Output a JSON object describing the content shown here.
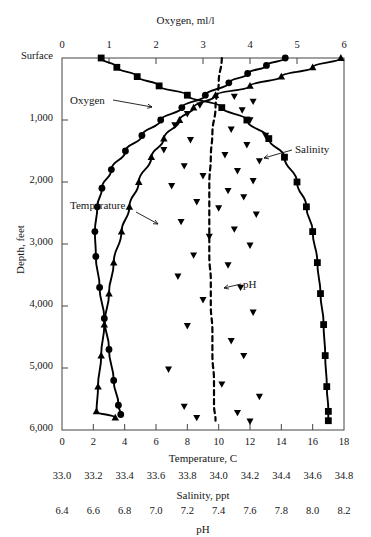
{
  "figure": {
    "type": "depth-profile",
    "top_axis_title": "Oxygen,  ml/l",
    "y_axis_title": "Depth,  feet",
    "bottom_axis_titles": [
      "Temperature,  C",
      "Salinity,  ppt",
      "pH"
    ],
    "surface_label": "Surface"
  },
  "curve_labels": {
    "oxygen": "Oxygen",
    "temperature": "Temperature",
    "salinity": "Salinity",
    "ph": "pH"
  },
  "chart_data": {
    "type": "line",
    "title": "Oxygen,  ml/l",
    "xlabel": "Temperature,  C",
    "ylabel": "Depth,  feet",
    "grid": false,
    "legend": "inline-annotations",
    "y_axis": {
      "label": "Depth,  feet",
      "ticks": [
        "Surface",
        "1,000",
        "2,000",
        "3,000",
        "4,000",
        "5,000",
        "6,000"
      ],
      "values": [
        0,
        1000,
        2000,
        3000,
        4000,
        5000,
        6000
      ],
      "ylim": [
        0,
        6000
      ],
      "inverted": true
    },
    "x_axes": [
      {
        "name": "oxygen",
        "position": "top",
        "label": "Oxygen,  ml/l",
        "ticks": [
          "0",
          "1",
          "2",
          "3",
          "4",
          "5",
          "6"
        ],
        "values": [
          0,
          1,
          2,
          3,
          4,
          5,
          6
        ],
        "xlim": [
          0,
          6
        ]
      },
      {
        "name": "temperature",
        "position": "bottom",
        "label": "Temperature,  C",
        "ticks": [
          "0",
          "2",
          "4",
          "6",
          "8",
          "10",
          "12",
          "14",
          "16",
          "18"
        ],
        "values": [
          0,
          2,
          4,
          6,
          8,
          10,
          12,
          14,
          16,
          18
        ],
        "xlim": [
          0,
          18
        ]
      },
      {
        "name": "salinity",
        "position": "bottom",
        "label": "Salinity,  ppt",
        "ticks": [
          "33.0",
          "33.2",
          "33.4",
          "33.6",
          "33.8",
          "34.0",
          "34.2",
          "34.4",
          "34.6",
          "34.8"
        ],
        "values": [
          33.0,
          33.2,
          33.4,
          33.6,
          33.8,
          34.0,
          34.2,
          34.4,
          34.6,
          34.8
        ],
        "xlim": [
          33.0,
          34.8
        ]
      },
      {
        "name": "ph",
        "position": "bottom",
        "label": "pH",
        "ticks": [
          "6.4",
          "6.6",
          "6.8",
          "7.0",
          "7.2",
          "7.4",
          "7.6",
          "7.8",
          "8.0",
          "8.2"
        ],
        "values": [
          6.4,
          6.6,
          6.8,
          7.0,
          7.2,
          7.4,
          7.6,
          7.8,
          8.0,
          8.2
        ],
        "xlim": [
          6.4,
          8.2
        ]
      }
    ],
    "series": [
      {
        "name": "Oxygen",
        "marker": "circle",
        "axis": "oxygen",
        "unit": "ml/l",
        "points": [
          {
            "depth": 0,
            "value": 4.75
          },
          {
            "depth": 120,
            "value": 4.35
          },
          {
            "depth": 250,
            "value": 3.95
          },
          {
            "depth": 400,
            "value": 3.55
          },
          {
            "depth": 600,
            "value": 3.05
          },
          {
            "depth": 800,
            "value": 2.55
          },
          {
            "depth": 1000,
            "value": 2.1
          },
          {
            "depth": 1250,
            "value": 1.7
          },
          {
            "depth": 1500,
            "value": 1.35
          },
          {
            "depth": 1800,
            "value": 1.05
          },
          {
            "depth": 2100,
            "value": 0.85
          },
          {
            "depth": 2400,
            "value": 0.75
          },
          {
            "depth": 2800,
            "value": 0.7
          },
          {
            "depth": 3200,
            "value": 0.72
          },
          {
            "depth": 3700,
            "value": 0.8
          },
          {
            "depth": 4200,
            "value": 0.9
          },
          {
            "depth": 4700,
            "value": 1.0
          },
          {
            "depth": 5200,
            "value": 1.1
          },
          {
            "depth": 5600,
            "value": 1.2
          },
          {
            "depth": 5750,
            "value": 1.25
          }
        ]
      },
      {
        "name": "Temperature",
        "marker": "triangle-up",
        "axis": "temperature",
        "unit": "C",
        "points": [
          {
            "depth": 0,
            "value": 17.8
          },
          {
            "depth": 150,
            "value": 16.0
          },
          {
            "depth": 300,
            "value": 14.0
          },
          {
            "depth": 450,
            "value": 12.0
          },
          {
            "depth": 600,
            "value": 9.8
          },
          {
            "depth": 800,
            "value": 8.4
          },
          {
            "depth": 1000,
            "value": 7.5
          },
          {
            "depth": 1300,
            "value": 6.5
          },
          {
            "depth": 1600,
            "value": 5.7
          },
          {
            "depth": 2000,
            "value": 4.9
          },
          {
            "depth": 2400,
            "value": 4.3
          },
          {
            "depth": 2800,
            "value": 3.8
          },
          {
            "depth": 3300,
            "value": 3.3
          },
          {
            "depth": 3800,
            "value": 3.0
          },
          {
            "depth": 4300,
            "value": 2.7
          },
          {
            "depth": 4800,
            "value": 2.5
          },
          {
            "depth": 5300,
            "value": 2.3
          },
          {
            "depth": 5700,
            "value": 2.2
          },
          {
            "depth": 5800,
            "value": 3.4
          }
        ]
      },
      {
        "name": "Salinity",
        "marker": "square",
        "axis": "salinity",
        "unit": "ppt",
        "points": [
          {
            "depth": 0,
            "value": 33.25
          },
          {
            "depth": 150,
            "value": 33.35
          },
          {
            "depth": 300,
            "value": 33.48
          },
          {
            "depth": 450,
            "value": 33.62
          },
          {
            "depth": 600,
            "value": 33.8
          },
          {
            "depth": 800,
            "value": 34.02
          },
          {
            "depth": 1000,
            "value": 34.18
          },
          {
            "depth": 1300,
            "value": 34.32
          },
          {
            "depth": 1600,
            "value": 34.42
          },
          {
            "depth": 2000,
            "value": 34.5
          },
          {
            "depth": 2400,
            "value": 34.56
          },
          {
            "depth": 2800,
            "value": 34.6
          },
          {
            "depth": 3300,
            "value": 34.63
          },
          {
            "depth": 3800,
            "value": 34.65
          },
          {
            "depth": 4300,
            "value": 34.67
          },
          {
            "depth": 4800,
            "value": 34.68
          },
          {
            "depth": 5300,
            "value": 34.69
          },
          {
            "depth": 5700,
            "value": 34.7
          },
          {
            "depth": 5850,
            "value": 34.7
          }
        ]
      },
      {
        "name": "pH",
        "marker": "triangle-down",
        "axis": "ph",
        "unit": "",
        "line_style": "dashed",
        "points": [
          {
            "depth": 0,
            "value": 7.42
          },
          {
            "depth": 400,
            "value": 7.4
          },
          {
            "depth": 800,
            "value": 7.38
          },
          {
            "depth": 1200,
            "value": 7.36
          },
          {
            "depth": 1600,
            "value": 7.35
          },
          {
            "depth": 2000,
            "value": 7.34
          },
          {
            "depth": 2400,
            "value": 7.34
          },
          {
            "depth": 2800,
            "value": 7.34
          },
          {
            "depth": 3200,
            "value": 7.34
          },
          {
            "depth": 3600,
            "value": 7.35
          },
          {
            "depth": 4000,
            "value": 7.35
          },
          {
            "depth": 4400,
            "value": 7.36
          },
          {
            "depth": 4800,
            "value": 7.36
          },
          {
            "depth": 5200,
            "value": 7.37
          },
          {
            "depth": 5600,
            "value": 7.37
          },
          {
            "depth": 5850,
            "value": 7.38
          }
        ],
        "scatter": [
          {
            "depth": 620,
            "value": 7.5
          },
          {
            "depth": 700,
            "value": 7.62
          },
          {
            "depth": 760,
            "value": 7.28
          },
          {
            "depth": 840,
            "value": 7.55
          },
          {
            "depth": 900,
            "value": 7.2
          },
          {
            "depth": 1000,
            "value": 7.6
          },
          {
            "depth": 1080,
            "value": 7.12
          },
          {
            "depth": 1150,
            "value": 7.48
          },
          {
            "depth": 1250,
            "value": 7.7
          },
          {
            "depth": 1320,
            "value": 7.22
          },
          {
            "depth": 1400,
            "value": 7.58
          },
          {
            "depth": 1480,
            "value": 7.05
          },
          {
            "depth": 1560,
            "value": 7.44
          },
          {
            "depth": 1660,
            "value": 7.66
          },
          {
            "depth": 1740,
            "value": 7.18
          },
          {
            "depth": 1820,
            "value": 7.52
          },
          {
            "depth": 1900,
            "value": 7.3
          },
          {
            "depth": 1980,
            "value": 7.62
          },
          {
            "depth": 2060,
            "value": 7.1
          },
          {
            "depth": 2140,
            "value": 7.46
          },
          {
            "depth": 2240,
            "value": 7.56
          },
          {
            "depth": 2320,
            "value": 7.26
          },
          {
            "depth": 2420,
            "value": 7.4
          },
          {
            "depth": 2520,
            "value": 7.64
          },
          {
            "depth": 2640,
            "value": 7.16
          },
          {
            "depth": 2760,
            "value": 7.5
          },
          {
            "depth": 2880,
            "value": 7.34
          },
          {
            "depth": 3020,
            "value": 7.6
          },
          {
            "depth": 3180,
            "value": 7.24
          },
          {
            "depth": 3340,
            "value": 7.46
          },
          {
            "depth": 3520,
            "value": 7.14
          },
          {
            "depth": 3700,
            "value": 7.54
          },
          {
            "depth": 3900,
            "value": 7.3
          },
          {
            "depth": 4100,
            "value": 7.62
          },
          {
            "depth": 4320,
            "value": 7.2
          },
          {
            "depth": 4560,
            "value": 7.48
          },
          {
            "depth": 4800,
            "value": 7.56
          },
          {
            "depth": 5020,
            "value": 7.08
          },
          {
            "depth": 5260,
            "value": 7.42
          },
          {
            "depth": 5460,
            "value": 7.66
          },
          {
            "depth": 5620,
            "value": 7.18
          },
          {
            "depth": 5720,
            "value": 7.52
          },
          {
            "depth": 5800,
            "value": 7.26
          },
          {
            "depth": 5860,
            "value": 7.6
          }
        ]
      }
    ]
  }
}
